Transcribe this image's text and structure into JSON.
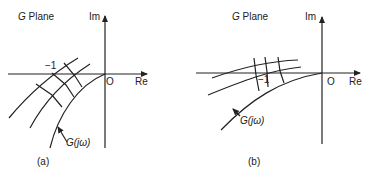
{
  "panels": [
    {
      "id": "a",
      "plane_label_prefix": "G",
      "plane_label": "Plane",
      "im_label": "Im",
      "re_label": "Re",
      "origin_label": "O",
      "point_label": "−1",
      "curve_label": "G(jω)",
      "caption": "(a)"
    },
    {
      "id": "b",
      "plane_label_prefix": "G",
      "plane_label": "Plane",
      "im_label": "Im",
      "re_label": "Re",
      "origin_label": "O",
      "point_label": "−1",
      "curve_label": "G(jω)",
      "caption": "(b)"
    }
  ],
  "colors": {
    "line": "#222222",
    "background": "#ffffff"
  }
}
